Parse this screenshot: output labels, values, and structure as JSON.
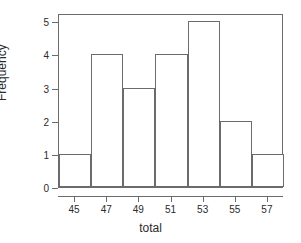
{
  "chart_data": {
    "type": "bar",
    "title": "",
    "subtitle": "",
    "xlabel": "total",
    "ylabel": "Frequency",
    "categories": [
      "44-46",
      "46-48",
      "48-50",
      "50-52",
      "52-54",
      "54-56",
      "56-58"
    ],
    "bin_edges": [
      44,
      46,
      48,
      50,
      52,
      54,
      56,
      58
    ],
    "values": [
      1,
      4,
      3,
      4,
      5,
      2,
      1
    ],
    "x_tick_labels": [
      "45",
      "47",
      "49",
      "51",
      "53",
      "55",
      "57"
    ],
    "x_tick_values": [
      45,
      47,
      49,
      51,
      53,
      55,
      57
    ],
    "y_tick_labels": [
      "0",
      "1",
      "2",
      "3",
      "4",
      "5"
    ],
    "y_tick_values": [
      0,
      1,
      2,
      3,
      4,
      5
    ],
    "xlim": [
      44,
      58
    ],
    "ylim": [
      0,
      5.25
    ],
    "grid": false,
    "legend": false,
    "legend_position": "none",
    "bar_fill": "#ffffff",
    "bar_stroke": "#6b6b6b",
    "axis_color": "#6b6b6b",
    "text_color": "#2a2a2a",
    "background": "#ffffff"
  }
}
